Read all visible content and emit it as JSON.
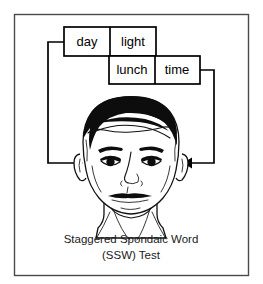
{
  "figure": {
    "type": "illustration-diagram",
    "title": "Staggered Spondaic Word (SSW) Test",
    "caption_line1": "Staggered Spondaic Word",
    "caption_line2": "(SSW) Test",
    "background_color": "#ffffff",
    "frame_color": "#4a4a52",
    "ink_color": "#000000"
  },
  "word_grid": {
    "description": "Two staggered rows of spondaic word halves",
    "rows": [
      {
        "row_index": 0,
        "cells": [
          {
            "label": "day",
            "ear": "right"
          },
          {
            "label": "light",
            "ear": "left"
          }
        ]
      },
      {
        "row_index": 1,
        "cells": [
          {
            "label": "lunch",
            "ear": "right"
          },
          {
            "label": "time",
            "ear": "left"
          }
        ]
      }
    ]
  },
  "arrows": [
    {
      "id": "left-arrow",
      "from": "day-cell",
      "to": "listener-right-ear",
      "direction": "right",
      "label": ""
    },
    {
      "id": "right-arrow",
      "from": "time-cell",
      "to": "listener-left-ear",
      "direction": "left",
      "label": ""
    }
  ],
  "listener": {
    "name": "listener-face",
    "description": "Front-facing line drawing of a man's head",
    "ears": [
      "right-ear",
      "left-ear"
    ]
  }
}
